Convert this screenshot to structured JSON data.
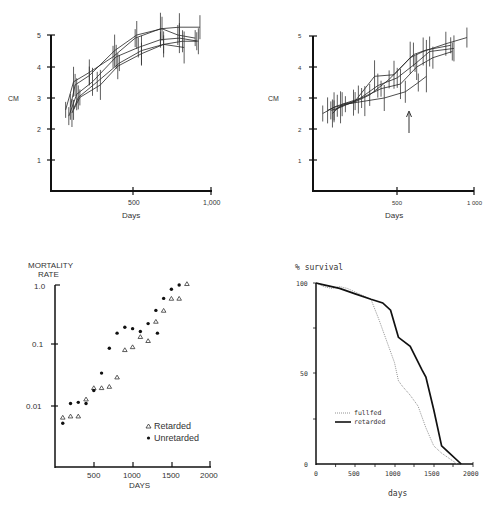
{
  "chart_data": [
    {
      "id": "growth_left",
      "type": "line",
      "title": "",
      "xlabel": "Days",
      "ylabel": "CM",
      "xlim": [
        0,
        1000
      ],
      "ylim": [
        0,
        5
      ],
      "xticks": [
        "500",
        "1,000"
      ],
      "yticks": [
        "1",
        "2",
        "3",
        "4",
        "5"
      ],
      "grid": false,
      "error_bars": true,
      "series": [
        {
          "name": "animal 1",
          "x": [
            80,
            130,
            230,
            380,
            520,
            680,
            800,
            930
          ],
          "y": [
            2.6,
            3.5,
            3.8,
            4.3,
            4.9,
            5.2,
            5.25,
            5.25
          ]
        },
        {
          "name": "animal 2",
          "x": [
            110,
            140,
            230,
            390,
            530,
            690,
            790,
            900
          ],
          "y": [
            2.7,
            3.4,
            3.7,
            4.5,
            5.0,
            5.2,
            5.0,
            4.9
          ]
        },
        {
          "name": "animal 3",
          "x": [
            100,
            150,
            250,
            400,
            540,
            680,
            800,
            920
          ],
          "y": [
            2.4,
            3.1,
            3.5,
            4.3,
            4.6,
            4.85,
            4.9,
            4.8
          ]
        },
        {
          "name": "animal 4",
          "x": [
            120,
            160,
            280,
            420,
            560,
            700,
            820,
            910
          ],
          "y": [
            2.5,
            3.0,
            3.5,
            4.1,
            4.5,
            4.7,
            4.8,
            4.8
          ]
        },
        {
          "name": "animal 5",
          "x": [
            130,
            170,
            300,
            410,
            560,
            700,
            830
          ],
          "y": [
            2.6,
            3.0,
            3.4,
            4.0,
            4.4,
            4.7,
            4.6
          ]
        }
      ]
    },
    {
      "id": "growth_right",
      "type": "line",
      "title": "",
      "xlabel": "Days",
      "ylabel": "CM",
      "xlim": [
        0,
        1000
      ],
      "ylim": [
        0,
        5
      ],
      "xticks": [
        "500",
        "1,000"
      ],
      "yticks": [
        "1",
        "2",
        "3",
        "4",
        "5"
      ],
      "grid": false,
      "error_bars": true,
      "annotation": "arrow pointing up at ~575 days",
      "series": [
        {
          "name": "animal 1",
          "x": [
            60,
            130,
            250,
            350,
            470,
            600,
            680,
            820,
            950
          ],
          "y": [
            2.5,
            2.7,
            2.85,
            3.1,
            3.6,
            4.3,
            4.5,
            4.75,
            4.95
          ]
        },
        {
          "name": "animal 2",
          "x": [
            90,
            150,
            260,
            380,
            500,
            620,
            700,
            850
          ],
          "y": [
            2.6,
            2.75,
            2.9,
            3.7,
            3.75,
            4.4,
            4.55,
            4.7
          ]
        },
        {
          "name": "animal 3",
          "x": [
            110,
            170,
            280,
            400,
            520,
            630,
            720,
            870
          ],
          "y": [
            2.6,
            2.7,
            2.95,
            3.4,
            3.65,
            4.1,
            4.5,
            4.6
          ]
        },
        {
          "name": "animal 4",
          "x": [
            120,
            180,
            300,
            420,
            540,
            640,
            740,
            860
          ],
          "y": [
            2.5,
            2.8,
            3.0,
            3.3,
            3.45,
            4.0,
            4.3,
            4.5
          ]
        },
        {
          "name": "animal 5",
          "x": [
            130,
            200,
            320,
            440,
            570,
            650,
            700
          ],
          "y": [
            2.6,
            2.8,
            2.9,
            3.0,
            3.2,
            3.5,
            3.7
          ]
        }
      ]
    },
    {
      "id": "mortality",
      "type": "scatter",
      "title": "",
      "xlabel": "DAYS",
      "ylabel": "MORTALITY RATE",
      "yscale": "log",
      "xlim": [
        0,
        2000
      ],
      "ylim": [
        0.001,
        1.0
      ],
      "xticks": [
        "500",
        "1000",
        "1500",
        "2000"
      ],
      "yticks": [
        "0.01",
        "0.1",
        "1.0"
      ],
      "grid": false,
      "legend_position": "lower right",
      "series": [
        {
          "name": "Retarded",
          "marker": "triangle-open",
          "x": [
            100,
            200,
            300,
            400,
            500,
            600,
            700,
            800,
            900,
            1000,
            1100,
            1200,
            1300,
            1400,
            1500,
            1600,
            1700
          ],
          "y": [
            0.0065,
            0.0068,
            0.0068,
            0.013,
            0.02,
            0.02,
            0.021,
            0.03,
            0.085,
            0.095,
            0.14,
            0.12,
            0.25,
            0.38,
            0.6,
            0.6,
            1.05
          ]
        },
        {
          "name": "Unretarded",
          "marker": "circle-filled",
          "x": [
            100,
            200,
            300,
            400,
            500,
            600,
            700,
            800,
            900,
            1000,
            1100,
            1200,
            1300,
            1320,
            1400,
            1500,
            1600
          ],
          "y": [
            0.0052,
            0.011,
            0.0115,
            0.011,
            0.018,
            0.035,
            0.09,
            0.16,
            0.2,
            0.19,
            0.17,
            0.23,
            0.38,
            0.16,
            0.6,
            0.85,
            1.0
          ]
        }
      ]
    },
    {
      "id": "survival",
      "type": "line",
      "title": "",
      "xlabel": "days",
      "ylabel": "% survival",
      "xlim": [
        0,
        2000
      ],
      "ylim": [
        0,
        100
      ],
      "xticks": [
        "0",
        "500",
        "1000",
        "1500",
        "2000"
      ],
      "yticks": [
        "0",
        "50",
        "100"
      ],
      "grid": false,
      "legend_position": "center left",
      "series": [
        {
          "name": "fullfed",
          "style": "dotted",
          "x": [
            0,
            100,
            200,
            300,
            400,
            500,
            600,
            700,
            800,
            900,
            1000,
            1050,
            1100,
            1200,
            1300,
            1400,
            1500,
            1600,
            1700,
            1800
          ],
          "y": [
            100,
            98,
            97,
            98,
            97,
            95,
            93,
            91,
            80,
            68,
            56,
            46,
            43,
            38,
            32,
            20,
            10,
            6,
            3,
            0
          ]
        },
        {
          "name": "retarded",
          "style": "solid",
          "x": [
            0,
            100,
            300,
            500,
            700,
            850,
            950,
            1050,
            1200,
            1350,
            1400,
            1500,
            1600,
            1700,
            1850
          ],
          "y": [
            100,
            99,
            97,
            94,
            91,
            89,
            85,
            70,
            65,
            52,
            48,
            30,
            10,
            6,
            0
          ]
        }
      ]
    }
  ],
  "panels": {
    "growth_left": {
      "ylabel": "CM",
      "xlabel": "Days",
      "yticks": [
        "1",
        "2",
        "3",
        "4",
        "5"
      ],
      "xticks": [
        "500",
        "1,000"
      ]
    },
    "growth_right": {
      "ylabel": "CM",
      "xlabel": "Days",
      "yticks": [
        "1",
        "2",
        "3",
        "4",
        "5"
      ],
      "xticks": [
        "500",
        "1 000"
      ]
    },
    "mortality": {
      "ylabel_line1": "MORTALITY",
      "ylabel_line2": "RATE",
      "xlabel": "DAYS",
      "yticks": [
        "0.01",
        "0.1",
        "1.0"
      ],
      "xticks": [
        "500",
        "1000",
        "1500",
        "2000"
      ],
      "legend": [
        "Retarded",
        "Unretarded"
      ]
    },
    "survival": {
      "ylabel": "% survival",
      "xlabel": "days",
      "yticks": [
        "0",
        "50",
        "100"
      ],
      "xticks": [
        "0",
        "500",
        "1000",
        "1500",
        "2000"
      ],
      "legend": [
        "fullfed",
        "retarded"
      ]
    }
  }
}
